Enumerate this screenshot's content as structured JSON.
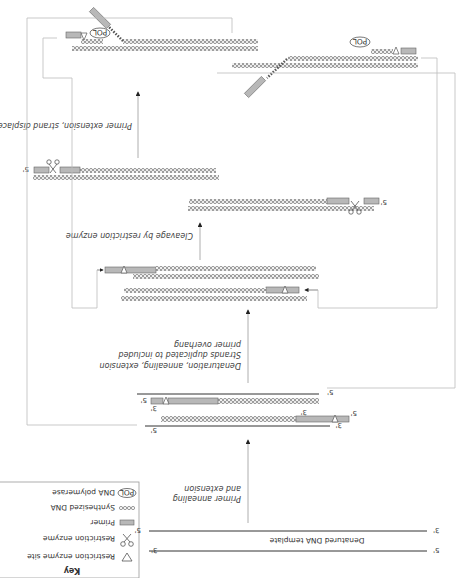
{
  "orientation": "rotated-180",
  "key": {
    "title": "Key",
    "items": [
      {
        "icon": "triangle-icon",
        "label": "Restriction enzyme site"
      },
      {
        "icon": "scissors-icon",
        "label": "Restriction enzyme"
      },
      {
        "icon": "primer-icon",
        "label": "Primer"
      },
      {
        "icon": "synthesized-dna-icon",
        "label": "Synthesized DNA"
      },
      {
        "icon": "pol-icon",
        "label": "DNA polymerase",
        "glyph": "POL"
      }
    ]
  },
  "template": {
    "label": "Denatured DNA template",
    "top_left": "3'",
    "top_right": "5'",
    "bottom_left": "5'",
    "bottom_right": "3'"
  },
  "steps": [
    {
      "label_lines": [
        "Primer annealing",
        "and extension"
      ]
    },
    {
      "label_lines": [
        "Denaturation, annealing, extension",
        "Strands duplicated to included",
        "primer overhang"
      ]
    },
    {
      "label_lines": [
        "Cleavage by restriction enzyme"
      ]
    },
    {
      "label_lines": [
        "Primer extension, strand displacement"
      ]
    }
  ],
  "end_labels": {
    "five": "5'",
    "three": "3'"
  },
  "pol_label": "POL",
  "colors": {
    "primer_fill": "#b8b8b8",
    "primer_stroke": "#666666",
    "strand": "#333333",
    "loop_line": "#bbbbbb",
    "arrow": "#222222"
  }
}
